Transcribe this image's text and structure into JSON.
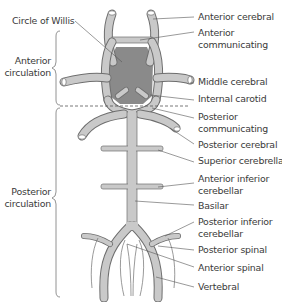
{
  "diagram": {
    "title_label": "Circle of Willis",
    "groups": [
      {
        "label_line1": "Anterior",
        "label_line2": "circulation"
      },
      {
        "label_line1": "Posterior",
        "label_line2": "circulation"
      }
    ],
    "labels": [
      {
        "line1": "Anterior cerebral",
        "line2": ""
      },
      {
        "line1": "Anterior",
        "line2": "communicating"
      },
      {
        "line1": "Middle cerebral",
        "line2": ""
      },
      {
        "line1": "Internal carotid",
        "line2": ""
      },
      {
        "line1": "Posterior",
        "line2": "communicating"
      },
      {
        "line1": "Posterior cerebral",
        "line2": ""
      },
      {
        "line1": "Superior cerebrellar",
        "line2": ""
      },
      {
        "line1": "Anterior inferior",
        "line2": "cerebellar"
      },
      {
        "line1": "Basilar",
        "line2": ""
      },
      {
        "line1": "Posterior inferior",
        "line2": "cerebellar"
      },
      {
        "line1": "Posterior spinal",
        "line2": ""
      },
      {
        "line1": "Anterior spinal",
        "line2": ""
      },
      {
        "line1": "Vertebral",
        "line2": ""
      }
    ],
    "colors": {
      "vessel_fill": "#c9c9c9",
      "vessel_outline": "#6e6e6e",
      "circle_region": "#8a8a8a",
      "text": "#3a3a3a"
    }
  }
}
